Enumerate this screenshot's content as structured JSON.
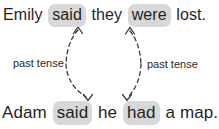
{
  "diagram": {
    "topic": "past tense",
    "top_sentence": {
      "full_text": "Emily said they were lost.",
      "words": [
        {
          "text": "Emily",
          "highlight": false
        },
        {
          "text": "said",
          "highlight": true
        },
        {
          "text": "they",
          "highlight": false
        },
        {
          "text": "were",
          "highlight": true
        },
        {
          "text": "lost.",
          "highlight": false
        }
      ]
    },
    "bottom_sentence": {
      "full_text": "Adam said he had a map.",
      "words": [
        {
          "text": "Adam",
          "highlight": false
        },
        {
          "text": "said",
          "highlight": true
        },
        {
          "text": "he",
          "highlight": false
        },
        {
          "text": "had",
          "highlight": true
        },
        {
          "text": "a",
          "highlight": false
        },
        {
          "text": "map.",
          "highlight": false
        }
      ]
    },
    "labels": {
      "left": "past tense",
      "right": "past tense"
    },
    "arrows": [
      {
        "name": "left-arrow",
        "connects": [
          "said (top)",
          "said (bottom)"
        ],
        "style": "dashed, double-headed"
      },
      {
        "name": "right-arrow",
        "connects": [
          "were (top)",
          "had (bottom)"
        ],
        "style": "dashed, double-headed"
      }
    ],
    "colors": {
      "background": "#ffffff",
      "text": "#1f1f1f",
      "highlight": "#d8d8d8",
      "arrow": "#3a3a3a"
    }
  }
}
